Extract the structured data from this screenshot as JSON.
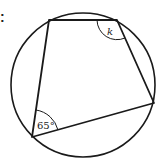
{
  "figure": {
    "type": "cyclic-quadrilateral",
    "marker_text": ":",
    "angles": [
      {
        "vertex": "bottom-left",
        "label": "65°",
        "value_degrees": 65,
        "known": true
      },
      {
        "vertex": "top-right",
        "label": "k",
        "value_degrees": null,
        "known": false
      }
    ],
    "colors": {
      "stroke": "#1a1a1a",
      "background": "#ffffff",
      "text": "#1a1a1a"
    }
  }
}
